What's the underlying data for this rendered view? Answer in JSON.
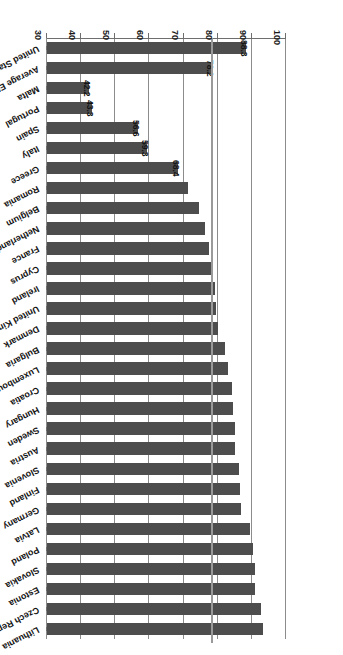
{
  "chart_data": {
    "type": "bar",
    "orientation": "horizontal",
    "title": "",
    "xlabel": "",
    "ylabel": "Population aged 25-64 years, %",
    "axis_title": "Population aged 25-64 years, %",
    "axis_ticks": [
      100,
      90,
      80,
      70,
      60,
      50,
      40,
      30
    ],
    "axis_min": 30,
    "axis_max": 100,
    "grid": true,
    "legend": "none",
    "bar_color": "#4d4d4d",
    "reference_line": {
      "label": "78.2",
      "value": 78.2,
      "color": "#9a9a9a"
    },
    "categories": [
      "United States",
      "Average EU-28",
      "Malta",
      "Portugal",
      "Spain",
      "Italy",
      "Greece",
      "Romania",
      "Belgium",
      "Netherlands",
      "France",
      "Cyprus",
      "Ireland",
      "United Kingdom",
      "Denmark",
      "Bulgaria",
      "Luxembourg",
      "Croatia",
      "Hungary",
      "Sweden",
      "Austria",
      "Slovenia",
      "Finland",
      "Germany",
      "Latvia",
      "Poland",
      "Slovakia",
      "Estonia",
      "Czech Republic",
      "Lithuania"
    ],
    "values": [
      88.3,
      78.2,
      42.2,
      43.3,
      56.6,
      59.3,
      68.4,
      71.4,
      74.6,
      76.4,
      77.5,
      78.3,
      79.2,
      79.6,
      80.0,
      82.2,
      83.0,
      84.2,
      84.5,
      85.0,
      85.2,
      86.3,
      86.5,
      86.9,
      89.5,
      90.2,
      90.8,
      91.0,
      92.8,
      93.2
    ],
    "data_labels": {
      "United States": "88.3",
      "Average EU-28": "78.2",
      "Greece": "68.4",
      "Italy": "59.3",
      "Spain": "56.6",
      "Portugal": "43.3",
      "Malta": "42.2"
    }
  }
}
